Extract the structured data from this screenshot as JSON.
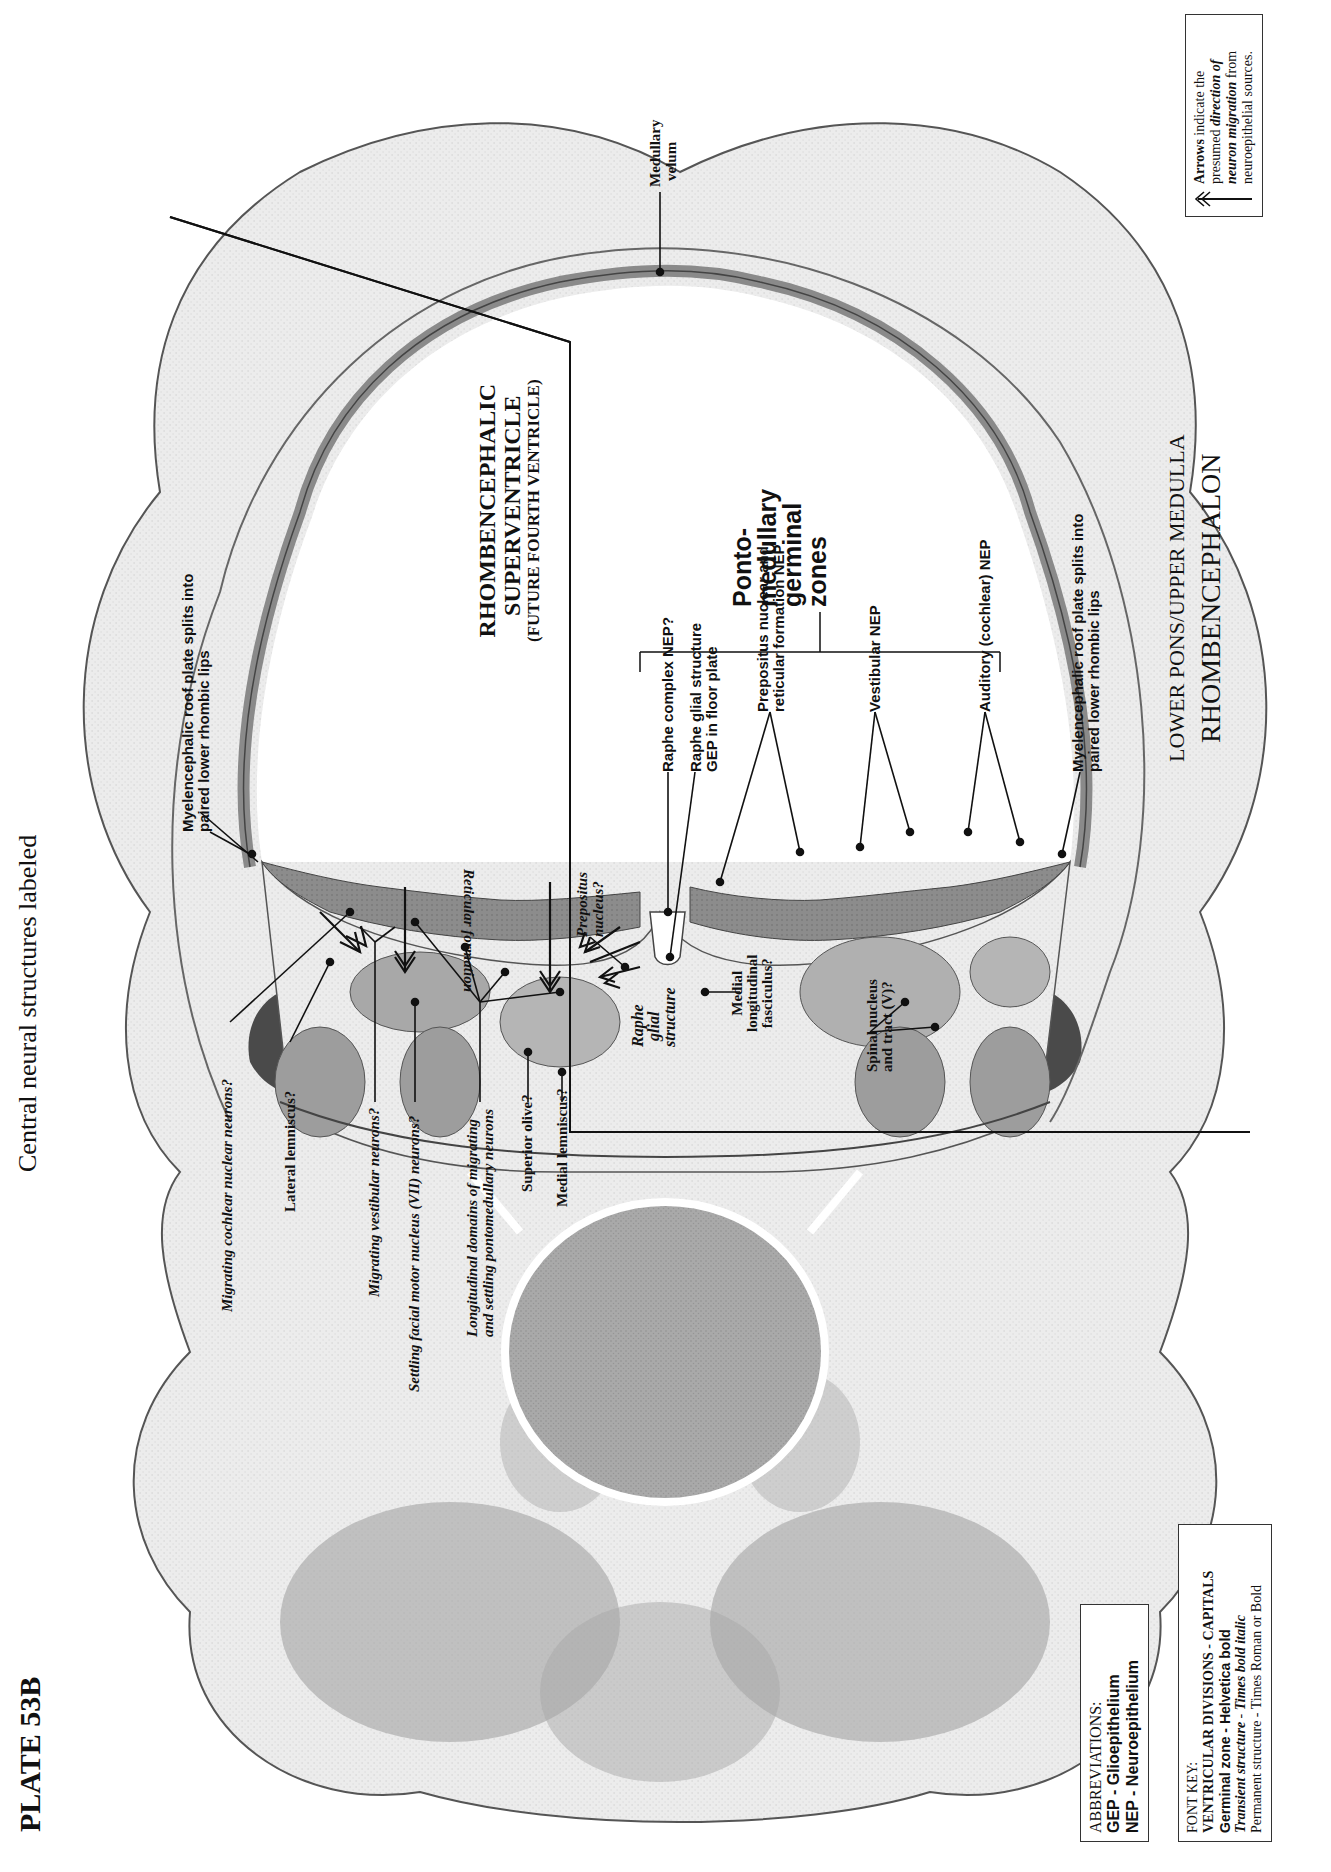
{
  "header": {
    "plate_number": "PLATE 53B",
    "subtitle": "Central neural structures labeled"
  },
  "ventricle": {
    "line1": "RHOMBENCEPHALIC",
    "line2": "SUPERVENTRICLE",
    "line3": "(FUTURE FOURTH VENTRICLE)"
  },
  "division": {
    "line1": "LOWER PONS/UPPER MEDULLA",
    "line2": "RHOMBENCEPHALON"
  },
  "germinal_zone_group": {
    "line1": "Ponto-",
    "line2": "medullary",
    "line3": "germinal",
    "line4": "zones"
  },
  "labels": {
    "medullary_velum_1": "Medullary",
    "medullary_velum_2": "velum",
    "roof_plate_left_1": "Myelencephalic  roof plate splits into",
    "roof_plate_left_2": "paired lower rhombic lips",
    "roof_plate_right_1": "Myelencephalic  roof plate splits into",
    "roof_plate_right_2": "paired lower rhombic lips",
    "raphe_complex_nep": "Raphe complex NEP?",
    "raphe_glial_gep_1": "Raphe glial structure",
    "raphe_glial_gep_2": "GEP in floor plate",
    "prepositus_nep_1": "Prepositus nuclear and",
    "prepositus_nep_2": "reticular formation NEP",
    "vestibular_nep": "Vestibular NEP",
    "auditory_nep": "Auditory (cochlear) NEP",
    "prepositus_nucleus_1": "Prepositus",
    "prepositus_nucleus_2": "nucleus?",
    "reticular_formation": "Reticular formation",
    "migrating_cochlear": "Migrating cochlear nuclear neurons?",
    "lateral_lemniscus": "Lateral lemniscus?",
    "migrating_vestibular": "Migrating vestibular neurons?",
    "facial_motor": "Settling facial motor nucleus (VII) neurons?",
    "longitudinal_domains_1": "Longitudinal domains of migrating",
    "longitudinal_domains_2": "and settling pontomedullary neurons",
    "superior_olive": "Superior olive?",
    "medial_lemniscus": "Medial lemniscus?",
    "raphe_glial_structure_1": "Raphe",
    "raphe_glial_structure_2": "glial",
    "raphe_glial_structure_3": "structure",
    "mlf_1": "Medial",
    "mlf_2": "longitudinal",
    "mlf_3": "fasciculus?",
    "spinal_v_1": "Spinal nucleus",
    "spinal_v_2": "and tract (V)?"
  },
  "arrow_legend": {
    "icon": "double-arrow-icon",
    "line1_a": "Arrows",
    "line1_b": " indicate the",
    "line2_a": "presumed ",
    "line2_b": "direction of",
    "line3_a": "neuron migration",
    "line3_b": " from",
    "line4": "neuroepithelial sources."
  },
  "abbreviations": {
    "title": "ABBREVIATIONS:",
    "items": [
      "GEP - Glioepithelium",
      "NEP - Neuroepithelium"
    ]
  },
  "font_key": {
    "title": "FONT KEY:",
    "line1": "VENTRICULAR DIVISIONS  -  CAPITALS",
    "line2": "Germinal zone - Helvetica bold",
    "line3_a": "Transient structure",
    "line3_b": " - ",
    "line3_c": "Times bold italic",
    "line4": "Permanent structure - Times Roman or Bold"
  },
  "colors": {
    "tissue_light": "#e9e9e9",
    "tissue_mid": "#c8c8c8",
    "tissue_dark": "#8f8f8f",
    "neuroepithelium": "#7d7d7d",
    "vessel": "#4a4a4a",
    "ink": "#111111"
  }
}
